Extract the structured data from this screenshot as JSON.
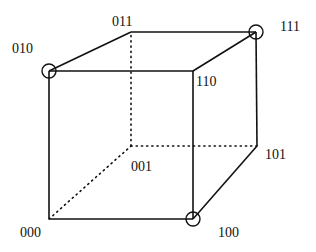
{
  "diagram": {
    "vertices": [
      {
        "id": "000",
        "label": "000",
        "x": 49,
        "y": 219,
        "label_x": 20,
        "label_y": 226,
        "marked": false
      },
      {
        "id": "100",
        "label": "100",
        "x": 193,
        "y": 219,
        "label_x": 218,
        "label_y": 226,
        "marked": true
      },
      {
        "id": "010",
        "label": "010",
        "x": 49,
        "y": 71,
        "label_x": 12,
        "label_y": 42,
        "marked": true
      },
      {
        "id": "110",
        "label": "110",
        "x": 193,
        "y": 71,
        "label_x": 196,
        "label_y": 75,
        "marked": false
      },
      {
        "id": "001",
        "label": "001",
        "x": 131,
        "y": 146,
        "label_x": 131,
        "label_y": 160,
        "marked": false
      },
      {
        "id": "101",
        "label": "101",
        "x": 257,
        "y": 146,
        "label_x": 265,
        "label_y": 148,
        "marked": false
      },
      {
        "id": "011",
        "label": "011",
        "x": 131,
        "y": 32,
        "label_x": 112,
        "label_y": 15,
        "marked": false
      },
      {
        "id": "111",
        "label": "111",
        "x": 256,
        "y": 32,
        "label_x": 280,
        "label_y": 20,
        "marked": true
      }
    ],
    "edges": [
      {
        "from": "000",
        "to": "100",
        "style": "solid"
      },
      {
        "from": "000",
        "to": "010",
        "style": "solid"
      },
      {
        "from": "010",
        "to": "110",
        "style": "solid"
      },
      {
        "from": "110",
        "to": "100",
        "style": "solid"
      },
      {
        "from": "010",
        "to": "011",
        "style": "solid"
      },
      {
        "from": "011",
        "to": "111",
        "style": "solid"
      },
      {
        "from": "110",
        "to": "111",
        "style": "solid"
      },
      {
        "from": "111",
        "to": "101",
        "style": "solid"
      },
      {
        "from": "101",
        "to": "100",
        "style": "solid"
      },
      {
        "from": "000",
        "to": "001",
        "style": "dotted"
      },
      {
        "from": "001",
        "to": "011",
        "style": "dotted"
      },
      {
        "from": "001",
        "to": "101",
        "style": "dotted"
      }
    ],
    "marker_radius": 7,
    "colors": {
      "line": "#111111",
      "background": "#ffffff"
    }
  }
}
